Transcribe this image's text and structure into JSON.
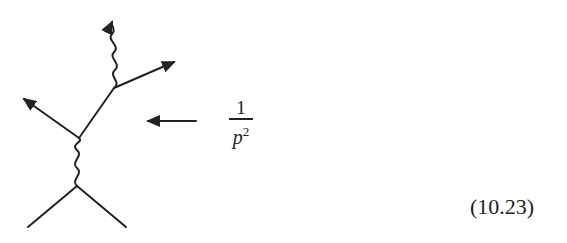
{
  "diagram": {
    "type": "feynman-diagram",
    "stroke_color": "#222222",
    "propagator_label": {
      "numerator": "1",
      "denominator_base": "p",
      "denominator_exponent": "2"
    },
    "pointer_arrow": "left-arrow pointing at internal fermion line"
  },
  "equation_number": "(10.23)"
}
